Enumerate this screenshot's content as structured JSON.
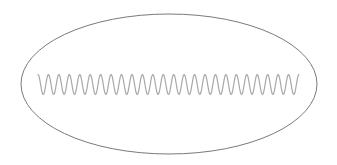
{
  "diagram": {
    "background": "#ffffff",
    "ellipse": {
      "cx": 169,
      "cy": 84,
      "rx": 148,
      "ry": 70,
      "stroke": "#7a7a7a",
      "stroke_width": 1
    },
    "wave": {
      "x_start": 38,
      "x_end": 299,
      "center_y": 84.5,
      "amplitude": 10,
      "cycles": 25,
      "phase": "starts-at-top",
      "stroke": "#a8a8a8",
      "stroke_width": 1.2
    }
  }
}
